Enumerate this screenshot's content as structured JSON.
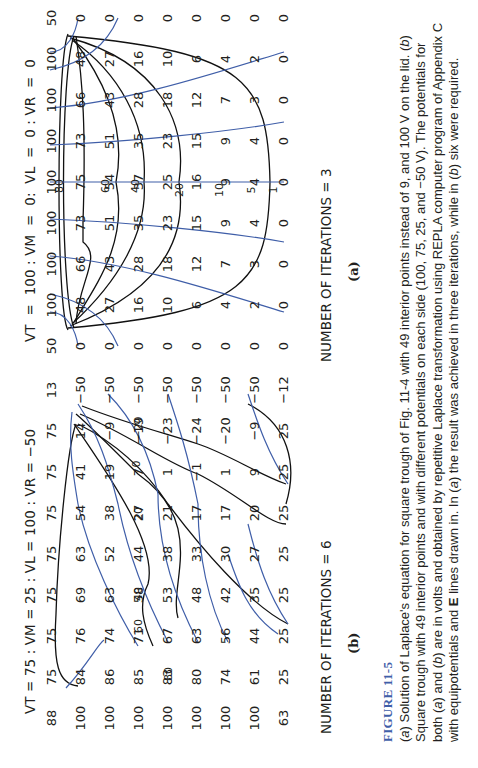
{
  "figure": {
    "label": "FIGURE 11-5",
    "caption_parts": [
      "(",
      "a",
      ") Solution of Laplace's equation for square trough of Fig. 11-4 with 49 interior points instead of 9, and 100 V on the lid. (",
      "b",
      ") Square trough with 49 interior points and with different potentials on each side (100, 75, 25, and −50 V). The potentials for both (",
      "a",
      ") and (",
      "b",
      ") are in volts and obtained by repetitive Laplace transformation using REPLA computer program of Appendix C with equipotentials and ",
      "E",
      " lines drawn in. In (",
      "a",
      ") the result was achieved in three iterations, while in (",
      "b",
      ") six were required."
    ]
  },
  "panels": [
    {
      "id": "a",
      "header": "VT  =  100 : VM  =  0:  VL  =  0 : VR  =  0",
      "iterations": "NUMBER OF ITERATIONS = 3",
      "sublabel": "(a)",
      "grid": [
        [
          "50",
          "100",
          "100",
          "100",
          "100",
          "100",
          "100",
          "100",
          "50"
        ],
        [
          "0",
          "48",
          "66",
          "73",
          "75",
          "73",
          "66",
          "48",
          "0"
        ],
        [
          "0",
          "27",
          "43",
          "51",
          "54",
          "51",
          "43",
          "27",
          "0"
        ],
        [
          "0",
          "16",
          "28",
          "35",
          "37",
          "35",
          "28",
          "16",
          "0"
        ],
        [
          "0",
          "10",
          "18",
          "23",
          "25",
          "23",
          "18",
          "10",
          "0"
        ],
        [
          "0",
          "6",
          "12",
          "15",
          "16",
          "15",
          "12",
          "6",
          "0"
        ],
        [
          "0",
          "4",
          "7",
          "9",
          "9",
          "9",
          "7",
          "4",
          "0"
        ],
        [
          "0",
          "2",
          "3",
          "4",
          "4",
          "4",
          "3",
          "2",
          "0"
        ],
        [
          "0",
          "0",
          "0",
          "0",
          "0",
          "0",
          "0",
          "0",
          "0"
        ]
      ],
      "equipotential_labels": [
        "80",
        "60",
        "40",
        "20",
        "10",
        "5",
        "1"
      ]
    },
    {
      "id": "b",
      "header": "VT = 75 : VM = 25 : VL = 100 : VR = −50",
      "iterations": "NUMBER OF ITERATIONS = 6",
      "sublabel": "(b)",
      "grid": [
        [
          "88",
          "75",
          "75",
          "75",
          "75",
          "75",
          "75",
          "75",
          "13"
        ],
        [
          "100",
          "84",
          "76",
          "69",
          "63",
          "54",
          "41",
          "14",
          "−50"
        ],
        [
          "100",
          "86",
          "74",
          "63",
          "52",
          "38",
          "19",
          "−9",
          "−50"
        ],
        [
          "100",
          "85",
          "71",
          "58",
          "44",
          "27",
          "7",
          "−19",
          "−50"
        ],
        [
          "100",
          "83",
          "67",
          "53",
          "38",
          "21",
          "1",
          "−23",
          "−50"
        ],
        [
          "100",
          "80",
          "63",
          "48",
          "33",
          "17",
          "−1",
          "−24",
          "−50"
        ],
        [
          "100",
          "74",
          "56",
          "42",
          "30",
          "17",
          "1",
          "−20",
          "−50"
        ],
        [
          "100",
          "61",
          "44",
          "35",
          "27",
          "20",
          "9",
          "−9",
          "−50"
        ],
        [
          "63",
          "25",
          "25",
          "25",
          "25",
          "25",
          "25",
          "25",
          "−12"
        ]
      ],
      "equipotential_labels": [
        "80",
        "60",
        "40",
        "20",
        "0",
        "−20"
      ]
    }
  ],
  "colors": {
    "text": "#231f20",
    "field_lines": "#3f5ea8",
    "equipotentials": "#111111",
    "figure_label": "#3f5ea8"
  }
}
